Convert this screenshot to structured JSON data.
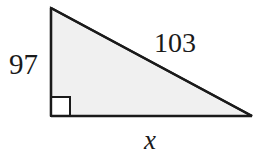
{
  "figure": {
    "type": "right-triangle-diagram",
    "background_color": "#ffffff",
    "fill_color": "#f0f0f0",
    "stroke_color": "#1a1a1a",
    "stroke_width": 2,
    "right_angle_marker": {
      "name": "right-angle-square",
      "size": 19,
      "fill_color": "#ffffff",
      "stroke_color": "#1a1a1a"
    },
    "vertices": {
      "top": {
        "x": 51,
        "y": 8
      },
      "bottom_left": {
        "x": 51,
        "y": 116
      },
      "bottom_right": {
        "x": 252,
        "y": 116
      }
    },
    "labels": {
      "vertical_leg": "97",
      "hypotenuse": "103",
      "horizontal_leg": "x"
    }
  }
}
